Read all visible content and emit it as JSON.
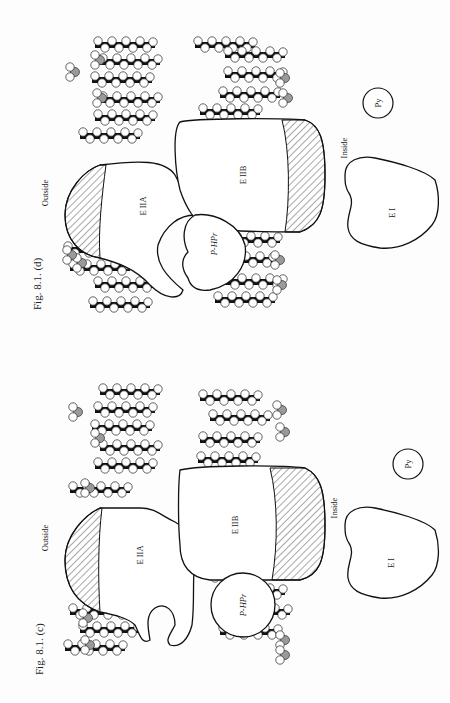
{
  "figures": [
    {
      "id": "d",
      "caption": "Fig. 8.1. (d)",
      "labels": {
        "outside": "Outside",
        "inside": "Inside",
        "e2a": "E IIA",
        "e2b": "E IIB",
        "phpr": "P-HPr",
        "e1": "E I",
        "py": "Py"
      }
    },
    {
      "id": "c",
      "caption": "Fig. 8.1. (c)",
      "labels": {
        "outside": "Outside",
        "inside": "Inside",
        "e2a": "E IIA",
        "e2b": "E IIB",
        "phpr": "P-HPr",
        "e1": "E I",
        "py": "Py"
      }
    }
  ],
  "colors": {
    "ink": "#111111",
    "lipid_fill": "#ffffff",
    "lipid_dark": "#111111",
    "lipid_grey": "#9a9a9a",
    "paper": "#fdfdfd"
  }
}
